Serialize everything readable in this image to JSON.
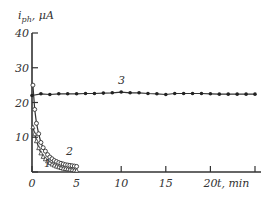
{
  "chart_data": {
    "type": "line",
    "title": "",
    "xlabel": "t, min",
    "ylabel": "i_ph, μA",
    "xlim": [
      0,
      25
    ],
    "ylim": [
      0,
      40
    ],
    "xticks": [
      0,
      5,
      10,
      15,
      20,
      25
    ],
    "xtick_labels": [
      "0",
      "5",
      "10",
      "15",
      "20",
      ""
    ],
    "yticks": [
      0,
      10,
      20,
      30,
      40
    ],
    "ytick_labels": [
      "",
      "10",
      "20",
      "30",
      "40"
    ],
    "grid": false,
    "legend": "curve numbers annotated inline",
    "series": [
      {
        "name": "1",
        "marker": "triangle-open",
        "x": [
          0.1,
          0.3,
          0.5,
          0.75,
          1.0,
          1.25,
          1.5,
          1.75,
          2.0,
          2.25,
          2.5,
          2.75,
          3.0,
          3.25,
          3.5,
          3.75,
          4.0,
          4.25,
          4.5,
          4.75,
          5.0
        ],
        "y": [
          13,
          11,
          9,
          7,
          5.5,
          4.5,
          3.8,
          3.2,
          2.7,
          2.3,
          2.0,
          1.7,
          1.5,
          1.3,
          1.1,
          1.0,
          0.9,
          0.8,
          0.7,
          0.6,
          0.5
        ]
      },
      {
        "name": "2",
        "marker": "circle-open",
        "x": [
          0.1,
          0.3,
          0.5,
          0.75,
          1.0,
          1.25,
          1.5,
          1.75,
          2.0,
          2.25,
          2.5,
          2.75,
          3.0,
          3.25,
          3.5,
          3.75,
          4.0,
          4.25,
          4.5,
          4.75,
          5.0
        ],
        "y": [
          25,
          18,
          14,
          11,
          8.5,
          7,
          6,
          5,
          4.3,
          3.8,
          3.3,
          3.0,
          2.7,
          2.5,
          2.3,
          2.1,
          2.0,
          1.9,
          1.8,
          1.7,
          1.6
        ]
      },
      {
        "name": "3",
        "marker": "circle-filled",
        "x": [
          0,
          1,
          2,
          3,
          4,
          5,
          6,
          7,
          8,
          9,
          10,
          11,
          12,
          13,
          14,
          15,
          16,
          17,
          18,
          19,
          20,
          21,
          22,
          23,
          24,
          25
        ],
        "y": [
          22,
          22.5,
          22.3,
          22.5,
          22.5,
          22.5,
          22.6,
          22.6,
          22.7,
          22.8,
          23,
          22.8,
          22.8,
          22.6,
          22.5,
          22.3,
          22.6,
          22.6,
          22.6,
          22.6,
          22.5,
          22.4,
          22.4,
          22.4,
          22.4,
          22.4
        ]
      }
    ],
    "annotations": [
      {
        "text": "1",
        "x": 1.6,
        "y": 1.5
      },
      {
        "text": "2",
        "x": 3.5,
        "y": 5.5
      },
      {
        "text": "3",
        "x": 10.5,
        "y": 26.5
      }
    ]
  },
  "labels": {
    "ylabel_main": "i",
    "ylabel_sub": "ph",
    "ylabel_unit": ", μA",
    "xlabel": "t, min",
    "curve1": "1",
    "curve2": "2",
    "curve3": "3"
  }
}
